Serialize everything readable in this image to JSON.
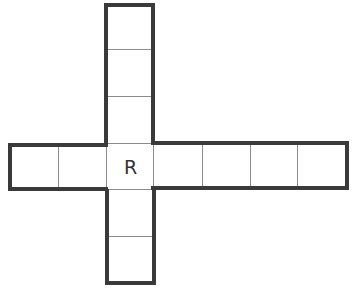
{
  "diagram": {
    "type": "cross-shaped grid",
    "line_color": "#3a3a3a",
    "divider_color": "#8c8c8c",
    "horizontal_row": {
      "cells": [
        "",
        "",
        "R",
        "",
        "",
        "",
        ""
      ]
    },
    "vertical_column": {
      "cells_above": [
        "",
        "",
        ""
      ],
      "cells_below": [
        "",
        ""
      ]
    },
    "center_letter": "R"
  }
}
